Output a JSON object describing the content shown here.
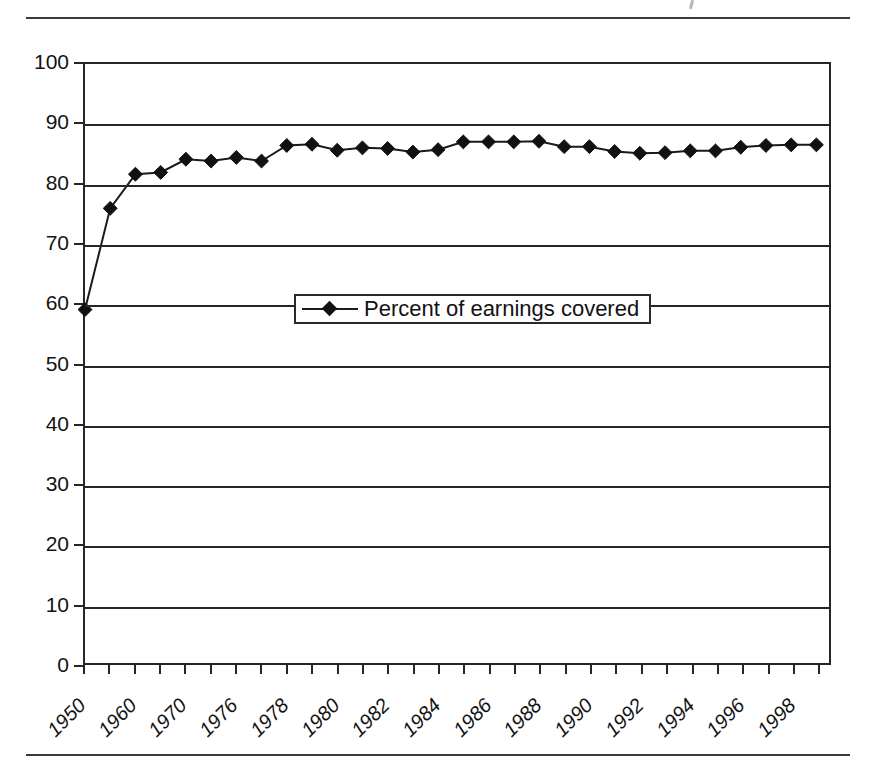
{
  "figure": {
    "rules": [
      "top-rule",
      "bottom-rule"
    ]
  },
  "legend": {
    "marker_icon": "diamond-marker-icon",
    "entries": [
      {
        "label": "Percent of earnings covered",
        "color": "#111111"
      }
    ]
  },
  "chart_data": {
    "type": "line",
    "title": "",
    "subtitle": "",
    "xlabel": "",
    "ylabel": "",
    "ylim": [
      0,
      100
    ],
    "ytick_labels": [
      "0",
      "10",
      "20",
      "30",
      "40",
      "50",
      "60",
      "70",
      "80",
      "90",
      "100"
    ],
    "ytick_values": [
      0,
      10,
      20,
      30,
      40,
      50,
      60,
      70,
      80,
      90,
      100
    ],
    "grid": true,
    "grid_axis": "y",
    "legend_position": "center",
    "marker": "diamond",
    "line_color": "#1a1a1a",
    "marker_color": "#111111",
    "x": [
      "1950",
      "1955",
      "1960",
      "1965",
      "1970",
      "1973",
      "1976",
      "1977",
      "1978",
      "1979",
      "1980",
      "1981",
      "1982",
      "1983",
      "1984",
      "1985",
      "1986",
      "1987",
      "1988",
      "1989",
      "1990",
      "1991",
      "1992",
      "1993",
      "1994",
      "1995",
      "1996",
      "1997",
      "1998",
      "1999"
    ],
    "xtick_labels": [
      "1950",
      "",
      "1960",
      "",
      "1970",
      "",
      "1976",
      "",
      "1978",
      "",
      "1980",
      "",
      "1982",
      "",
      "1984",
      "",
      "1986",
      "",
      "1988",
      "",
      "1990",
      "",
      "1992",
      "",
      "1994",
      "",
      "1996",
      "",
      "1998",
      ""
    ],
    "xtick_labels_visible": [
      "1950",
      "1960",
      "1970",
      "1976",
      "1978",
      "1980",
      "1982",
      "1984",
      "1986",
      "1988",
      "1990",
      "1992",
      "1994",
      "1996",
      "1998"
    ],
    "series": [
      {
        "name": "Percent of earnings covered",
        "values": [
          59.0,
          75.9,
          81.6,
          81.9,
          84.1,
          83.8,
          84.4,
          83.8,
          86.4,
          86.6,
          85.6,
          86.0,
          85.9,
          85.3,
          85.7,
          87.0,
          87.0,
          87.0,
          87.1,
          86.2,
          86.2,
          85.4,
          85.1,
          85.2,
          85.5,
          85.5,
          86.1,
          86.4,
          86.5,
          86.5
        ]
      }
    ]
  }
}
